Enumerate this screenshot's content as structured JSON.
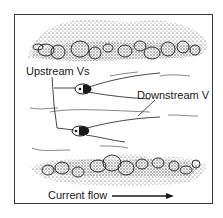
{
  "figure": {
    "labels": {
      "upstream": "Upstream Vs",
      "downstream": "Downstream V",
      "current": "Current flow"
    },
    "elements": {
      "top_bank": "gravel-bank-top",
      "bottom_bank": "gravel-bank-bottom",
      "fish_count": 2,
      "flow_direction": "left-to-right"
    },
    "colors": {
      "ink": "#1a1a1a",
      "stipple": "#555555",
      "background": "#ffffff",
      "frame": "#3a3a3a"
    }
  }
}
